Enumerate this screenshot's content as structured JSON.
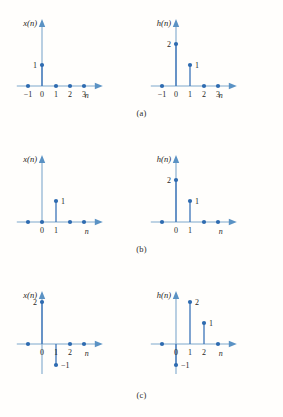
{
  "figure": {
    "background_color": "#fffefc",
    "accent_color": "#2e6bb0",
    "axis_color": "#7fa8cc"
  },
  "panels": [
    {
      "id": "a",
      "caption": "(a)",
      "plots": [
        {
          "id": "a-x",
          "ylabel": "x(n)",
          "xlabel": "n",
          "xticks": [
            "-1",
            "0",
            "1",
            "2",
            "3"
          ],
          "chart_data": {
            "type": "stem",
            "title": "x(n)",
            "xlabel": "n",
            "ylabel": "x(n)",
            "x": [
              -1,
              0,
              1,
              2,
              3
            ],
            "values": [
              0,
              1,
              0,
              0,
              0
            ],
            "point_labels": [
              "",
              "1",
              "",
              "",
              ""
            ],
            "ylim": [
              0,
              2
            ],
            "xlim": [
              -1.8,
              4.2
            ],
            "grid": false
          }
        },
        {
          "id": "a-h",
          "ylabel": "h(n)",
          "xlabel": "n",
          "xticks": [
            "-1",
            "0",
            "1",
            "2",
            "3"
          ],
          "chart_data": {
            "type": "stem",
            "title": "h(n)",
            "xlabel": "n",
            "ylabel": "h(n)",
            "x": [
              -1,
              0,
              1,
              2,
              3
            ],
            "values": [
              0,
              2,
              1,
              0,
              0
            ],
            "point_labels": [
              "",
              "2",
              "1",
              "",
              ""
            ],
            "ylim": [
              0,
              2
            ],
            "xlim": [
              -1.8,
              4.2
            ],
            "grid": false
          }
        }
      ]
    },
    {
      "id": "b",
      "caption": "(b)",
      "plots": [
        {
          "id": "b-x",
          "ylabel": "x(n)",
          "xlabel": "n",
          "xticks": [
            "",
            "0",
            "1",
            "",
            ""
          ],
          "chart_data": {
            "type": "stem",
            "title": "x(n)",
            "xlabel": "n",
            "ylabel": "x(n)",
            "x": [
              -1,
              0,
              1,
              2,
              3
            ],
            "values": [
              0,
              0,
              1,
              0,
              0
            ],
            "point_labels": [
              "",
              "",
              "1",
              "",
              ""
            ],
            "ylim": [
              0,
              2
            ],
            "xlim": [
              -1.8,
              4.2
            ],
            "grid": false
          }
        },
        {
          "id": "b-h",
          "ylabel": "h(n)",
          "xlabel": "n",
          "xticks": [
            "",
            "0",
            "1",
            "",
            ""
          ],
          "chart_data": {
            "type": "stem",
            "title": "h(n)",
            "xlabel": "n",
            "ylabel": "h(n)",
            "x": [
              -1,
              0,
              1,
              2,
              3
            ],
            "values": [
              0,
              2,
              1,
              0,
              0
            ],
            "point_labels": [
              "",
              "2",
              "1",
              "",
              ""
            ],
            "ylim": [
              0,
              2
            ],
            "xlim": [
              -1.8,
              4.2
            ],
            "grid": false
          }
        }
      ]
    },
    {
      "id": "c",
      "caption": "(c)",
      "plots": [
        {
          "id": "c-x",
          "ylabel": "x(n)",
          "xlabel": "n",
          "xticks": [
            "",
            "0",
            "1",
            "2",
            ""
          ],
          "chart_data": {
            "type": "stem",
            "title": "x(n)",
            "xlabel": "n",
            "ylabel": "x(n)",
            "x": [
              -1,
              0,
              1,
              2,
              3
            ],
            "values": [
              0,
              2,
              -1,
              0,
              0
            ],
            "point_labels": [
              "",
              "2",
              "-1",
              "",
              ""
            ],
            "ylim": [
              -1,
              2
            ],
            "xlim": [
              -1.8,
              4.2
            ],
            "grid": false
          }
        },
        {
          "id": "c-h",
          "ylabel": "h(n)",
          "xlabel": "n",
          "xticks": [
            "",
            "0",
            "1",
            "2",
            ""
          ],
          "chart_data": {
            "type": "stem",
            "title": "h(n)",
            "xlabel": "n",
            "ylabel": "h(n)",
            "x": [
              -1,
              0,
              1,
              2,
              3
            ],
            "values": [
              0,
              -1,
              2,
              1,
              0
            ],
            "point_labels": [
              "",
              "-1",
              "2",
              "1",
              ""
            ],
            "ylim": [
              -1,
              2
            ],
            "xlim": [
              -1.8,
              4.2
            ],
            "grid": false
          }
        }
      ]
    }
  ]
}
